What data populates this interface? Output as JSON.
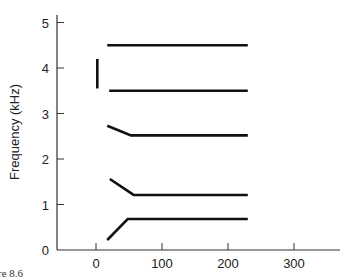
{
  "chart_data": {
    "type": "line",
    "title": "",
    "xlabel": "",
    "ylabel": "Frequency (kHz)",
    "xlim": [
      -57,
      385
    ],
    "ylim": [
      0,
      5.2
    ],
    "x_ticks": [
      "0",
      "100",
      "200",
      "300"
    ],
    "y_ticks": [
      "0",
      "1",
      "2",
      "3",
      "4",
      "5"
    ],
    "grid": false,
    "legend": null,
    "series": [
      {
        "name": "F1",
        "points": [
          [
            17,
            0.22
          ],
          [
            48,
            0.68
          ],
          [
            230,
            0.68
          ]
        ]
      },
      {
        "name": "F2",
        "points": [
          [
            21,
            1.56
          ],
          [
            57,
            1.21
          ],
          [
            230,
            1.21
          ]
        ]
      },
      {
        "name": "F3",
        "points": [
          [
            17,
            2.73
          ],
          [
            53,
            2.52
          ],
          [
            230,
            2.52
          ]
        ]
      },
      {
        "name": "F4",
        "points": [
          [
            20,
            3.5
          ],
          [
            230,
            3.5
          ]
        ]
      },
      {
        "name": "F5",
        "points": [
          [
            17,
            4.5
          ],
          [
            230,
            4.5
          ]
        ]
      },
      {
        "name": "burst",
        "points": [
          [
            2,
            3.55
          ],
          [
            2,
            4.2
          ]
        ]
      }
    ]
  },
  "caption": "re 8.6"
}
